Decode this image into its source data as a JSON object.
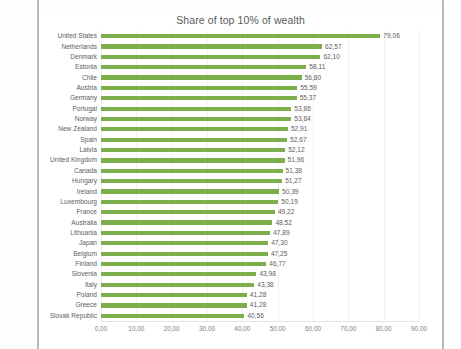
{
  "chart_data": {
    "type": "bar",
    "orientation": "horizontal",
    "title": "Share of top 10% of wealth",
    "xlabel": "",
    "ylabel": "",
    "xlim": [
      0,
      90
    ],
    "xticks": [
      "0,00",
      "10,00",
      "20,00",
      "30,00",
      "40,00",
      "50,00",
      "60,00",
      "70,00",
      "80,00",
      "90,00"
    ],
    "grid": true,
    "legend": "none",
    "bar_color": "#7CAE4C",
    "decimal_separator": ",",
    "categories": [
      "United States",
      "Netherlands",
      "Denmark",
      "Estonia",
      "Chile",
      "Austria",
      "Germany",
      "Portugal",
      "Norway",
      "New Zealand",
      "Spain",
      "Latvia",
      "United Kingdom",
      "Canada",
      "Hungary",
      "Ireland",
      "Luxembourg",
      "France",
      "Australia",
      "Lithuania",
      "Japan",
      "Belgium",
      "Finland",
      "Slovenia",
      "Italy",
      "Poland",
      "Greece",
      "Slovak Republic"
    ],
    "values": [
      79.06,
      62.57,
      62.1,
      58.11,
      56.8,
      55.59,
      55.37,
      53.86,
      53.84,
      52.91,
      52.67,
      52.12,
      51.96,
      51.38,
      51.27,
      50.39,
      50.19,
      49.22,
      48.52,
      47.89,
      47.3,
      47.25,
      46.77,
      43.98,
      43.38,
      41.28,
      41.28,
      40.56
    ],
    "value_labels": [
      "79,06",
      "62,57",
      "62,10",
      "58,11",
      "56,80",
      "55,59",
      "55,37",
      "53,86",
      "53,84",
      "52,91",
      "52,67",
      "52,12",
      "51,96",
      "51,38",
      "51,27",
      "50,39",
      "50,19",
      "49,22",
      "48,52",
      "47,89",
      "47,30",
      "47,25",
      "46,77",
      "43,98",
      "43,38",
      "41,28",
      "41,28",
      "40,56"
    ]
  }
}
